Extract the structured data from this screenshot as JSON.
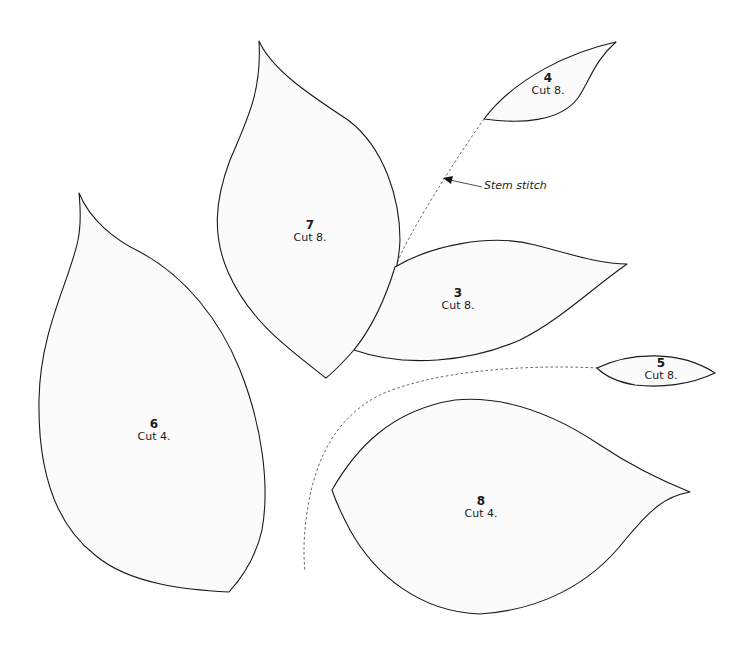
{
  "colors": {
    "background": "#ffffff",
    "piece_fill": "#fbfbfb",
    "outline": "#1a1a1a",
    "stitch_line": "#555555"
  },
  "pieces": [
    {
      "id": "piece-4",
      "number": "4",
      "cut": "Cut 8."
    },
    {
      "id": "piece-7",
      "number": "7",
      "cut": "Cut 8."
    },
    {
      "id": "piece-3",
      "number": "3",
      "cut": "Cut 8."
    },
    {
      "id": "piece-6",
      "number": "6",
      "cut": "Cut 4."
    },
    {
      "id": "piece-5",
      "number": "5",
      "cut": "Cut 8."
    },
    {
      "id": "piece-8",
      "number": "8",
      "cut": "Cut 4."
    }
  ],
  "annotations": {
    "stem_stitch": "Stem stitch"
  }
}
